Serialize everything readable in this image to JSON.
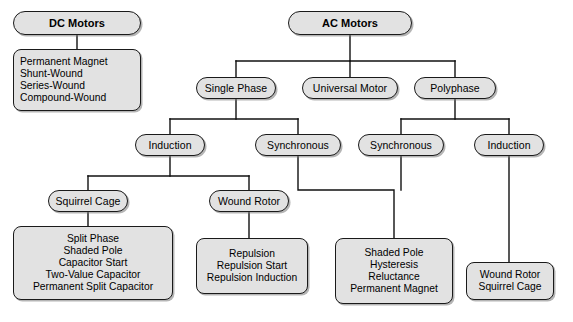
{
  "diagram": {
    "style": {
      "node_fill": "#e2e2e2",
      "node_border": "#1a1a1a",
      "wire_color": "#111111",
      "background": "#ffffff"
    },
    "nodes": {
      "dc_motors": {
        "label": "DC Motors"
      },
      "ac_motors": {
        "label": "AC Motors"
      },
      "dc_types": {
        "lines": [
          "Permanent Magnet",
          "Shunt-Wound",
          "Series-Wound",
          "Compound-Wound"
        ]
      },
      "single_phase": {
        "label": "Single Phase"
      },
      "universal_motor": {
        "label": "Universal Motor"
      },
      "polyphase": {
        "label": "Polyphase"
      },
      "sp_induction": {
        "label": "Induction"
      },
      "sp_synchronous": {
        "label": "Synchronous"
      },
      "pp_synchronous": {
        "label": "Synchronous"
      },
      "pp_induction": {
        "label": "Induction"
      },
      "squirrel_cage": {
        "label": "Squirrel Cage"
      },
      "wound_rotor": {
        "label": "Wound Rotor"
      },
      "squirrel_cage_types": {
        "lines": [
          "Split Phase",
          "Shaded Pole",
          "Capacitor Start",
          "Two-Value Capacitor",
          "Permanent Split Capacitor"
        ]
      },
      "wound_rotor_types": {
        "lines": [
          "Repulsion",
          "Repulsion Start",
          "Repulsion Induction"
        ]
      },
      "pp_synchronous_types": {
        "lines": [
          "Shaded Pole",
          "Hysteresis",
          "Reluctance",
          "Permanent Magnet"
        ]
      },
      "pp_induction_types": {
        "lines": [
          "Wound Rotor",
          "Squirrel Cage"
        ]
      }
    }
  }
}
